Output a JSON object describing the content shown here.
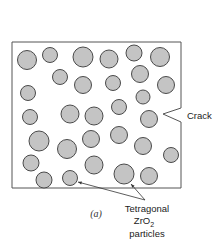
{
  "diagram": {
    "labels": {
      "crack": "Crack",
      "particles_line1": "Tetragonal",
      "particles_line2_main": "ZrO",
      "particles_line2_sub": "2",
      "particles_line3": "particles",
      "caption": "(a)"
    },
    "colors": {
      "particle_fill": "#c4c4c4",
      "particle_stroke": "#4a4a4a",
      "box_stroke": "#555555",
      "background": "#ffffff"
    },
    "box": {
      "x1": 12,
      "y1": 42,
      "x2": 181,
      "y2": 188
    },
    "crack_notch": {
      "top_y": 108,
      "tip_x": 163,
      "tip_y": 114,
      "bottom_y": 122
    },
    "particles": [
      {
        "cx": 27,
        "cy": 60,
        "r": 9.5
      },
      {
        "cx": 50,
        "cy": 55,
        "r": 7.5
      },
      {
        "cx": 83,
        "cy": 57,
        "r": 10
      },
      {
        "cx": 109,
        "cy": 59,
        "r": 9
      },
      {
        "cx": 134,
        "cy": 53,
        "r": 8
      },
      {
        "cx": 160,
        "cy": 57,
        "r": 9.5
      },
      {
        "cx": 60,
        "cy": 77,
        "r": 7.5
      },
      {
        "cx": 83,
        "cy": 85,
        "r": 8.5
      },
      {
        "cx": 113,
        "cy": 83,
        "r": 7.5
      },
      {
        "cx": 140,
        "cy": 74,
        "r": 8.5
      },
      {
        "cx": 166,
        "cy": 85,
        "r": 8.5
      },
      {
        "cx": 28,
        "cy": 93,
        "r": 7.5
      },
      {
        "cx": 143,
        "cy": 97,
        "r": 7
      },
      {
        "cx": 30,
        "cy": 117,
        "r": 7.5
      },
      {
        "cx": 70,
        "cy": 114,
        "r": 9
      },
      {
        "cx": 94,
        "cy": 116,
        "r": 9
      },
      {
        "cx": 119,
        "cy": 107,
        "r": 7.5
      },
      {
        "cx": 149,
        "cy": 119,
        "r": 8.5
      },
      {
        "cx": 39,
        "cy": 141,
        "r": 10
      },
      {
        "cx": 67,
        "cy": 149,
        "r": 9.5
      },
      {
        "cx": 91,
        "cy": 139,
        "r": 8.5
      },
      {
        "cx": 119,
        "cy": 135,
        "r": 8.5
      },
      {
        "cx": 143,
        "cy": 146,
        "r": 8.5
      },
      {
        "cx": 31,
        "cy": 163,
        "r": 8
      },
      {
        "cx": 94,
        "cy": 165,
        "r": 9
      },
      {
        "cx": 171,
        "cy": 155,
        "r": 7.5
      },
      {
        "cx": 44,
        "cy": 180,
        "r": 8
      },
      {
        "cx": 70,
        "cy": 178,
        "r": 7.5
      },
      {
        "cx": 124,
        "cy": 174,
        "r": 10
      },
      {
        "cx": 149,
        "cy": 176,
        "r": 8.5
      }
    ],
    "pointer_lines": [
      {
        "x1": 145,
        "y1": 200,
        "x2": 78,
        "y2": 182
      },
      {
        "x1": 145,
        "y1": 200,
        "x2": 131,
        "y2": 184
      }
    ]
  }
}
